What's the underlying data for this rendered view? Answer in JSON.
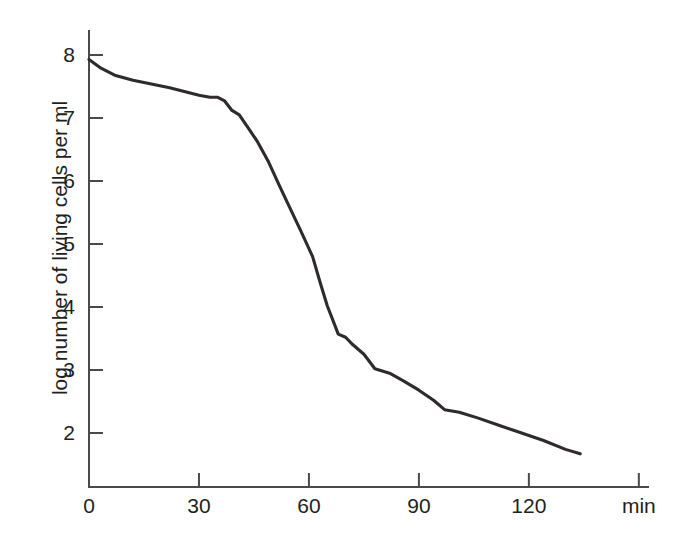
{
  "chart_data": {
    "type": "line",
    "title": "",
    "subtitle": "",
    "xlabel": "min",
    "ylabel": "log number of living cells per ml",
    "xlim": [
      0,
      150
    ],
    "ylim": [
      1.4,
      8.3
    ],
    "grid": false,
    "legend": null,
    "x_ticks": [
      {
        "value": 0,
        "label": "0"
      },
      {
        "value": 30,
        "label": "30"
      },
      {
        "value": 60,
        "label": "60"
      },
      {
        "value": 90,
        "label": "90"
      },
      {
        "value": 120,
        "label": "120"
      },
      {
        "value": 150,
        "label": "min"
      }
    ],
    "y_ticks": [
      {
        "value": 8,
        "label": "8"
      },
      {
        "value": 7,
        "label": "7"
      },
      {
        "value": 6,
        "label": "6"
      },
      {
        "value": 5,
        "label": "5"
      },
      {
        "value": 4,
        "label": "4"
      },
      {
        "value": 3,
        "label": "3"
      },
      {
        "value": 2,
        "label": "2"
      }
    ],
    "series": [
      {
        "name": "living cells",
        "color": "#2e2b2a",
        "x": [
          0,
          3,
          7,
          12,
          17,
          22,
          26,
          30,
          33,
          35,
          37,
          39,
          41,
          43,
          46,
          49,
          52,
          55,
          58,
          61,
          63,
          65,
          68,
          70,
          72,
          75,
          78,
          82,
          86,
          90,
          94,
          97,
          101,
          106,
          112,
          118,
          124,
          130,
          134
        ],
        "y": [
          7.93,
          7.8,
          7.68,
          7.6,
          7.54,
          7.48,
          7.42,
          7.36,
          7.33,
          7.33,
          7.27,
          7.12,
          7.05,
          6.88,
          6.62,
          6.3,
          5.92,
          5.55,
          5.18,
          4.8,
          4.4,
          4.02,
          3.57,
          3.52,
          3.4,
          3.25,
          3.02,
          2.95,
          2.82,
          2.68,
          2.52,
          2.37,
          2.33,
          2.24,
          2.12,
          2.0,
          1.88,
          1.74,
          1.67
        ]
      }
    ]
  },
  "axis": {
    "x_unit_label": "min"
  }
}
